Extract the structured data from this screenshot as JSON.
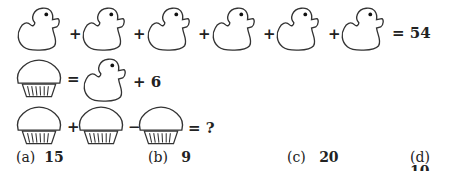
{
  "equations": {
    "row1": {
      "terms": [
        "duck",
        "duck",
        "duck",
        "duck",
        "duck",
        "duck"
      ],
      "operators": [
        "+",
        "+",
        "+",
        "+",
        "+"
      ],
      "result": "= 54"
    },
    "row2": {
      "left": "muffin",
      "equals": "=",
      "right": "duck",
      "suffix": "+ 6"
    },
    "row3": {
      "terms": [
        "muffin",
        "muffin",
        "muffin"
      ],
      "operators": [
        "+",
        "−"
      ],
      "result": "= ?"
    }
  },
  "options": [
    {
      "label": "(a)",
      "value": "15"
    },
    {
      "label": "(b)",
      "value": "9"
    },
    {
      "label": "(c)",
      "value": "20"
    },
    {
      "label": "(d)",
      "value": "10"
    }
  ]
}
